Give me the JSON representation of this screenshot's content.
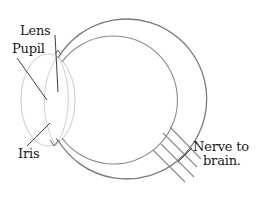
{
  "diagram": {
    "labels": {
      "lens": "Lens",
      "pupil": "Pupil",
      "iris": "Iris",
      "nerve_line1": "Nerve to",
      "nerve_line2": "brain."
    },
    "colors": {
      "outline": "#7a7a7a",
      "outline_light": "#c8c8c8",
      "leader_line": "#2a2a2a",
      "text": "#1a1a1a",
      "background": "#ffffff"
    }
  }
}
